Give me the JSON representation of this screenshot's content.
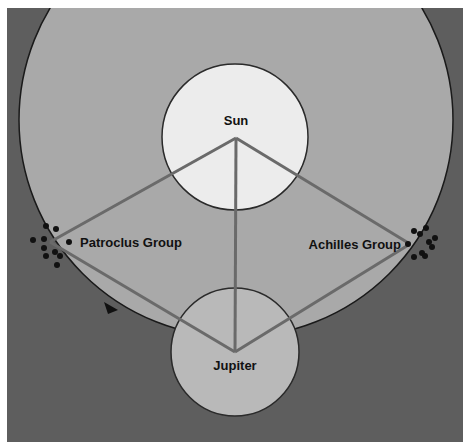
{
  "diagram": {
    "type": "orbital diagram",
    "bodies": {
      "sun": {
        "label": "Sun",
        "color": "#ececec"
      },
      "jupiter": {
        "label": "Jupiter",
        "color": "#b9b9b9"
      }
    },
    "groups": {
      "patroclus": {
        "label": "Patroclus Group"
      },
      "achilles": {
        "label": "Achilles Group"
      }
    },
    "colors": {
      "background": "#5e5e5e",
      "orbit_fill": "#a9a9a9",
      "lines": "#6a6a6a",
      "outline": "#222222"
    }
  }
}
